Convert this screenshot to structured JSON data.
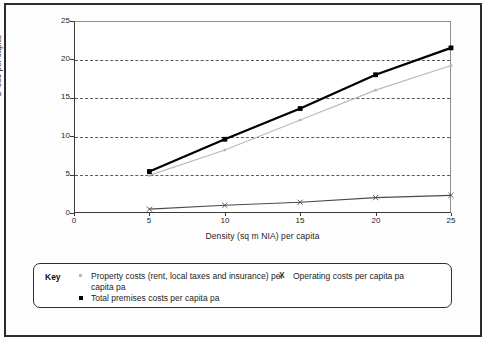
{
  "chart_data": {
    "type": "line",
    "title": "",
    "xlabel": "Density (sq m NIA) per capita",
    "ylabel": "£ '000 per capita",
    "x": [
      5,
      10,
      15,
      20,
      25
    ],
    "xlim": [
      0,
      25
    ],
    "ylim": [
      0,
      25
    ],
    "xticks": [
      "0",
      "5",
      "10",
      "15",
      "20",
      "25"
    ],
    "yticks": [
      "0",
      "5",
      "10",
      "15",
      "20",
      "25"
    ],
    "grid": "horizontal-dashed",
    "legend_position": "below-plot",
    "series": [
      {
        "name": "Property costs (rent, local taxes and insurance) per capita pa",
        "marker": "dot",
        "color": "#b9b9b9",
        "values": [
          4.9,
          8.2,
          12.1,
          16.0,
          19.2
        ]
      },
      {
        "name": "Operating costs per capita pa",
        "marker": "x",
        "color": "#4a4a4a",
        "values": [
          0.5,
          1.0,
          1.4,
          2.0,
          2.3
        ]
      },
      {
        "name": "Total premises costs per capita pa",
        "marker": "square",
        "color": "#000000",
        "values": [
          5.4,
          9.6,
          13.6,
          18.0,
          21.5
        ]
      }
    ]
  },
  "axes": {
    "y_title": "£ '000 per capita",
    "x_title": "Density (sq m NIA) per capita",
    "y_tick_labels": [
      "25",
      "20",
      "15",
      "10",
      "5",
      "0"
    ],
    "x_tick_labels": [
      "0",
      "5",
      "10",
      "15",
      "20",
      "25"
    ]
  },
  "legend": {
    "key_label": "Key",
    "entries": [
      {
        "marker": "dot",
        "label": "Property costs (rent, local taxes and insurance) per capita pa"
      },
      {
        "marker": "square",
        "label": "Total premises costs per capita pa"
      },
      {
        "marker": "x",
        "label": "Operating costs per capita pa"
      }
    ]
  }
}
